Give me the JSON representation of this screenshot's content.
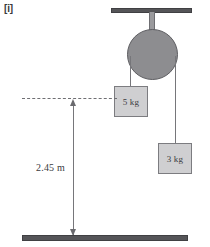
{
  "figure": {
    "part_label": "[i]",
    "width_px": 210,
    "height_px": 247
  },
  "apparatus": {
    "ceiling_support": {
      "name": "ceiling bar",
      "color": "#555558"
    },
    "pulley_rod": {
      "name": "support rod",
      "color": "#9a9a9d"
    },
    "pulley": {
      "name": "pulley wheel",
      "color": "#8d8d90"
    },
    "string_left": {
      "name": "string to 5 kg block"
    },
    "string_right": {
      "name": "string to 3 kg block"
    }
  },
  "masses": [
    {
      "id": "left",
      "label": "5 kg",
      "value": 5,
      "unit": "kg",
      "side": "left",
      "resting_on_reference_level": true
    },
    {
      "id": "right",
      "label": "3 kg",
      "value": 3,
      "unit": "kg",
      "side": "right",
      "resting_on_reference_level": false
    }
  ],
  "annotations": {
    "reference_line": {
      "name": "dashed reference level",
      "style": "dashed"
    },
    "height_dimension": {
      "label": "2.45 m",
      "value": 2.45,
      "unit": "m",
      "arrow_ends": "both"
    },
    "ground": {
      "name": "ground bar",
      "color": "#555558"
    }
  },
  "colors": {
    "metal_dark": "#555558",
    "pulley_grey": "#8d8d90",
    "block_grey": "#cfcfd1",
    "line_grey": "#76767a",
    "text": "#3b3b3e"
  }
}
